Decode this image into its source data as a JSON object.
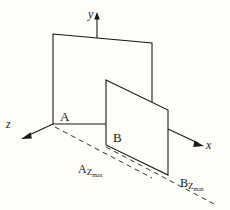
{
  "figure": {
    "background_color": "#fefdf8",
    "line_color": "#1a1a1a"
  },
  "axes": {
    "y": {
      "label": "y",
      "direction": "up"
    },
    "x": {
      "label": "x",
      "direction": "down-right"
    },
    "z": {
      "label": "z",
      "direction": "down-left"
    },
    "origin": {
      "x": 53,
      "y": 124
    }
  },
  "planes": [
    {
      "id": "A",
      "label": "A",
      "corners": [
        [
          53,
          34
        ],
        [
          152,
          43
        ],
        [
          152,
          124
        ],
        [
          53,
          124
        ]
      ]
    },
    {
      "id": "B",
      "label": "B",
      "corners": [
        [
          106,
          80
        ],
        [
          168,
          110
        ],
        [
          168,
          175
        ],
        [
          106,
          145
        ]
      ]
    }
  ],
  "measurements": [
    {
      "id": "A-zmax",
      "base": "A",
      "sub": "Z",
      "subsub": "max",
      "text": "AZmax"
    },
    {
      "id": "B-zmax",
      "base": "B",
      "sub": "Z",
      "subsub": "max",
      "text": "BZmax"
    }
  ],
  "dashed_lines": [
    {
      "name": "A-zmax-guide",
      "from": [
        55,
        127
      ],
      "to": [
        152,
        178
      ]
    },
    {
      "name": "B-zmax-guide",
      "from": [
        106,
        147
      ],
      "to": [
        215,
        205
      ]
    }
  ]
}
